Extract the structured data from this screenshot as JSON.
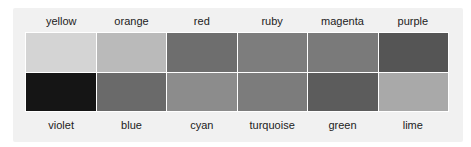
{
  "palette": {
    "top_row": [
      {
        "name": "yellow",
        "color": "#d4d4d4"
      },
      {
        "name": "orange",
        "color": "#bababa"
      },
      {
        "name": "red",
        "color": "#6e6e6e"
      },
      {
        "name": "ruby",
        "color": "#7d7d7d"
      },
      {
        "name": "magenta",
        "color": "#7a7a7a"
      },
      {
        "name": "purple",
        "color": "#555555"
      }
    ],
    "bottom_row": [
      {
        "name": "violet",
        "color": "#151515"
      },
      {
        "name": "blue",
        "color": "#6a6a6a"
      },
      {
        "name": "cyan",
        "color": "#8c8c8c"
      },
      {
        "name": "turquoise",
        "color": "#7c7c7c"
      },
      {
        "name": "green",
        "color": "#5c5c5c"
      },
      {
        "name": "lime",
        "color": "#a9a9a9"
      }
    ]
  }
}
